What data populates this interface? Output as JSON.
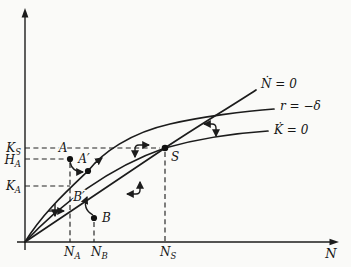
{
  "figure": {
    "axis": {
      "x_label": "N",
      "y_ticks": [
        {
          "base": "K",
          "sub": "S"
        },
        {
          "base": "H",
          "sub": "A"
        },
        {
          "base": "K",
          "sub": "A"
        }
      ],
      "x_ticks": [
        {
          "base": "N",
          "sub": "A"
        },
        {
          "base": "N",
          "sub": "B"
        },
        {
          "base": "N",
          "sub": "S"
        }
      ]
    },
    "curves": [
      {
        "id": "n-dot-zero",
        "label": "Ṅ = 0"
      },
      {
        "id": "r-equals-minus-delta",
        "label": "r = −δ"
      },
      {
        "id": "k-dot-zero",
        "label": "K̇ = 0"
      }
    ],
    "points": [
      {
        "id": "A",
        "label": "A"
      },
      {
        "id": "A1",
        "label": "A′"
      },
      {
        "id": "B",
        "label": "B"
      },
      {
        "id": "B1",
        "label": "B′"
      },
      {
        "id": "S",
        "label": "S"
      }
    ],
    "colors": {
      "ink": "#1c1c1c",
      "background": "#fafaf8"
    }
  }
}
